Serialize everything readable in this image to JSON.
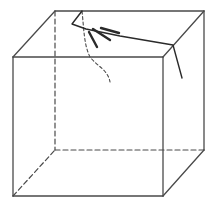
{
  "diagram": {
    "title": "Cube with crack at top-back edge",
    "colors": {
      "stroke": "#4a4a4a",
      "crack": "#2a2a2a",
      "background": "#ffffff"
    },
    "cube": {
      "front_face": {
        "x1": 13,
        "y1": 57,
        "x2": 163,
        "y2": 196
      },
      "back_face": {
        "x1": 55,
        "y1": 11,
        "x2": 204,
        "y2": 150
      },
      "visible_edges": [
        [
          13,
          57,
          163,
          57
        ],
        [
          163,
          57,
          163,
          196
        ],
        [
          163,
          196,
          13,
          196
        ],
        [
          13,
          196,
          13,
          57
        ],
        [
          13,
          57,
          55,
          11
        ],
        [
          55,
          11,
          204,
          11
        ],
        [
          163,
          57,
          204,
          11
        ],
        [
          204,
          11,
          204,
          150
        ],
        [
          163,
          196,
          204,
          150
        ]
      ],
      "hidden_edges": [
        [
          55,
          11,
          55,
          150
        ],
        [
          55,
          150,
          204,
          150
        ],
        [
          13,
          196,
          55,
          150
        ]
      ]
    },
    "crack": {
      "main_path": "M82,11 L72,24 L86,29 L120,36 L173,45 L182,78",
      "hidden_path": "M82,11 C84,30 84,45 90,57 C97,66 108,70 110,82",
      "strokes": [
        [
          89,
          32,
          97,
          47
        ],
        [
          93,
          29,
          110,
          40
        ],
        [
          101,
          28,
          119,
          33
        ]
      ]
    }
  }
}
